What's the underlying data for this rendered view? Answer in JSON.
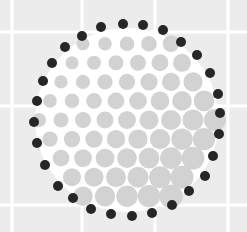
{
  "image": {
    "description": "Circle packing illustration: light gray dots inside a circular boundary outlined by dark dots on a gray grid background",
    "background_color": "#ececec",
    "grid_color": "#ffffff",
    "disc_color": "#ffffff",
    "inner_dot_color": "#d2d2d2",
    "outer_dot_color": "#262626",
    "grid": {
      "vertical_x": [
        12,
        82,
        155,
        228
      ],
      "horizontal_y": [
        32,
        106,
        205
      ]
    },
    "disc": {
      "cx": 127,
      "cy": 120,
      "r": 92
    },
    "outer_dots": [
      [
        123,
        24
      ],
      [
        143,
        25
      ],
      [
        163,
        30
      ],
      [
        181,
        42
      ],
      [
        197,
        55
      ],
      [
        210,
        73
      ],
      [
        218,
        94
      ],
      [
        220,
        113
      ],
      [
        219,
        134
      ],
      [
        213,
        156
      ],
      [
        205,
        176
      ],
      [
        189,
        191
      ],
      [
        172,
        205
      ],
      [
        152,
        213
      ],
      [
        132,
        216
      ],
      [
        111,
        214
      ],
      [
        91,
        209
      ],
      [
        73,
        198
      ],
      [
        58,
        186
      ],
      [
        45,
        165
      ],
      [
        37,
        143
      ],
      [
        34,
        122
      ],
      [
        37,
        101
      ],
      [
        43,
        81
      ],
      [
        52,
        63
      ],
      [
        65,
        47
      ],
      [
        82,
        36
      ],
      [
        101,
        27
      ]
    ]
  }
}
